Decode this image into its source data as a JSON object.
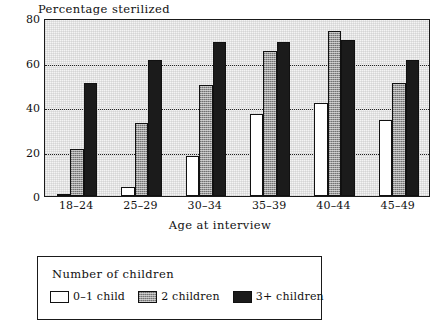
{
  "chart_data": {
    "type": "bar",
    "title": "Percentage sterilized",
    "xlabel": "Age at interview",
    "ylabel": "",
    "categories": [
      "18–24",
      "25–29",
      "30–34",
      "35–39",
      "40–44",
      "45–49"
    ],
    "series": [
      {
        "name": "0–1 child",
        "values": [
          1,
          4,
          18,
          37,
          42,
          34
        ]
      },
      {
        "name": "2 children",
        "values": [
          21,
          33,
          50,
          65,
          74,
          51
        ]
      },
      {
        "name": "3+ children",
        "values": [
          51,
          61,
          69,
          69,
          70,
          61
        ]
      }
    ],
    "ylim": [
      0,
      80
    ],
    "yticks": [
      0,
      20,
      40,
      60,
      80
    ],
    "ytick_labels": [
      "0",
      "20",
      "40",
      "60",
      "80"
    ],
    "grid": "horizontal-dotted",
    "legend_position": "below-plot",
    "legend_title": "Number of children",
    "colors": {
      "series_0": "#ffffff",
      "series_1": "#9a9a9a",
      "series_2": "#1b1b1b",
      "axis": "#1a1a1a",
      "plot_background": "#f4f4f4",
      "grid": "#222222"
    }
  }
}
